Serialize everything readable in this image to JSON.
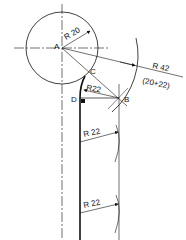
{
  "diagram": {
    "points": {
      "A": "A",
      "B": "B",
      "C": "C",
      "D": "D"
    },
    "labels": {
      "circle_radius": "R 20",
      "construction_radius": "R 42",
      "construction_sum": "(20+22)",
      "tangent_arc_radius": "R22",
      "offset_radius_1": "R 22",
      "offset_radius_2": "R 22"
    },
    "colors": {
      "line": "#111111",
      "background": "#ffffff"
    }
  }
}
